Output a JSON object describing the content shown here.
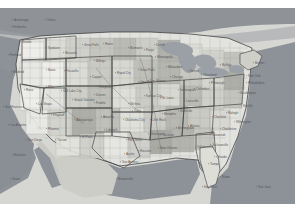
{
  "map": {
    "title": "United States reference map",
    "projection_note": "continental US with Alaska, Hawaii, Guam and Puerto Rico labels",
    "colors": {
      "background": "#ffffff",
      "land_base": "#e2e2de",
      "water_ocean": "#8d9298",
      "water_lake": "#9aa0a6",
      "border_state": "#3a3a3a",
      "border_county": "#9c9c98",
      "label_text": "#4a4a4a",
      "fill_light": "#efefec",
      "fill_mid": "#cfcfc9",
      "fill_dark": "#a9a9a3",
      "fill_darker": "#8f8f89"
    },
    "water_bodies": [
      {
        "name": "Pacific Ocean"
      },
      {
        "name": "Atlantic Ocean"
      },
      {
        "name": "Gulf of Mexico"
      },
      {
        "name": "Great Lakes"
      },
      {
        "name": "Gulf of California"
      }
    ],
    "cities": [
      {
        "name": "Anchorage",
        "x": 14,
        "y": 13,
        "size": "sm"
      },
      {
        "name": "Fairbanks",
        "x": 13,
        "y": 20,
        "size": "sm"
      },
      {
        "name": "Yukon",
        "x": 47,
        "y": 13,
        "size": "sm"
      },
      {
        "name": "Seattle",
        "x": 22,
        "y": 35,
        "size": "sm"
      },
      {
        "name": "Portland",
        "x": 10,
        "y": 48,
        "size": "sm"
      },
      {
        "name": "Spokane",
        "x": 48,
        "y": 41,
        "size": "sm"
      },
      {
        "name": "Missoula",
        "x": 65,
        "y": 46,
        "size": "sm"
      },
      {
        "name": "Havre",
        "x": 105,
        "y": 37,
        "size": "sm"
      },
      {
        "name": "Great Falls",
        "x": 84,
        "y": 38,
        "size": "sm"
      },
      {
        "name": "Billings",
        "x": 96,
        "y": 54,
        "size": "sm"
      },
      {
        "name": "Bismarck",
        "x": 130,
        "y": 41,
        "size": "sm"
      },
      {
        "name": "Fargo",
        "x": 146,
        "y": 43,
        "size": "sm"
      },
      {
        "name": "Medford",
        "x": 13,
        "y": 65,
        "size": "sm"
      },
      {
        "name": "Boise",
        "x": 48,
        "y": 63,
        "size": "sm"
      },
      {
        "name": "Pocatello",
        "x": 66,
        "y": 64,
        "size": "sm"
      },
      {
        "name": "Casper",
        "x": 92,
        "y": 70,
        "size": "sm"
      },
      {
        "name": "Rapid City",
        "x": 117,
        "y": 66,
        "size": "sm"
      },
      {
        "name": "Sioux Falls",
        "x": 140,
        "y": 63,
        "size": "sm"
      },
      {
        "name": "Minneapolis",
        "x": 157,
        "y": 50,
        "size": "sm"
      },
      {
        "name": "Duluth",
        "x": 156,
        "y": 38,
        "size": "sm"
      },
      {
        "name": "Reno",
        "x": 26,
        "y": 83,
        "size": "sm"
      },
      {
        "name": "Elko",
        "x": 48,
        "y": 80,
        "size": "sm"
      },
      {
        "name": "Salt Lake City",
        "x": 63,
        "y": 84,
        "size": "sm"
      },
      {
        "name": "Cheyenne",
        "x": 99,
        "y": 80,
        "size": "sm"
      },
      {
        "name": "Denver",
        "x": 96,
        "y": 88,
        "size": "sm"
      },
      {
        "name": "Omaha",
        "x": 140,
        "y": 75,
        "size": "sm"
      },
      {
        "name": "Des Moines",
        "x": 150,
        "y": 74,
        "size": "sm"
      },
      {
        "name": "Chicago",
        "x": 172,
        "y": 70,
        "size": "sm"
      },
      {
        "name": "Milwaukee",
        "x": 168,
        "y": 60,
        "size": "sm"
      },
      {
        "name": "Detroit",
        "x": 190,
        "y": 64,
        "size": "sm"
      },
      {
        "name": "Cleveland",
        "x": 203,
        "y": 68,
        "size": "sm"
      },
      {
        "name": "Buffalo",
        "x": 222,
        "y": 58,
        "size": "sm"
      },
      {
        "name": "Boston",
        "x": 255,
        "y": 56,
        "size": "sm"
      },
      {
        "name": "New York",
        "x": 248,
        "y": 69,
        "size": "sm"
      },
      {
        "name": "Philadelphia",
        "x": 248,
        "y": 76,
        "size": "sm"
      },
      {
        "name": "Pittsburgh",
        "x": 211,
        "y": 76,
        "size": "sm"
      },
      {
        "name": "San Francisco",
        "x": 5,
        "y": 100,
        "size": "sm"
      },
      {
        "name": "Las Vegas",
        "x": 38,
        "y": 97,
        "size": "sm"
      },
      {
        "name": "Grand Junction",
        "x": 74,
        "y": 93,
        "size": "sm"
      },
      {
        "name": "Pueblo",
        "x": 96,
        "y": 96,
        "size": "sm"
      },
      {
        "name": "Wichita",
        "x": 130,
        "y": 97,
        "size": "sm"
      },
      {
        "name": "Kansas City",
        "x": 146,
        "y": 89,
        "size": "sm"
      },
      {
        "name": "St. Louis",
        "x": 162,
        "y": 91,
        "size": "sm"
      },
      {
        "name": "Indianapolis",
        "x": 180,
        "y": 83,
        "size": "sm"
      },
      {
        "name": "Columbus",
        "x": 196,
        "y": 82,
        "size": "sm"
      },
      {
        "name": "Washington",
        "x": 240,
        "y": 86,
        "size": "sm"
      },
      {
        "name": "Los Angeles",
        "x": 10,
        "y": 118,
        "size": "sm"
      },
      {
        "name": "San Diego",
        "x": 28,
        "y": 133,
        "size": "sm"
      },
      {
        "name": "Phoenix",
        "x": 48,
        "y": 122,
        "size": "sm"
      },
      {
        "name": "Flagstaff",
        "x": 53,
        "y": 108,
        "size": "sm"
      },
      {
        "name": "Albuquerque",
        "x": 76,
        "y": 113,
        "size": "sm"
      },
      {
        "name": "Amarillo",
        "x": 103,
        "y": 110,
        "size": "sm"
      },
      {
        "name": "Oklahoma City",
        "x": 125,
        "y": 113,
        "size": "sm"
      },
      {
        "name": "Tulsa",
        "x": 134,
        "y": 104,
        "size": "sm"
      },
      {
        "name": "Little Rock",
        "x": 152,
        "y": 113,
        "size": "sm"
      },
      {
        "name": "Memphis",
        "x": 164,
        "y": 107,
        "size": "sm"
      },
      {
        "name": "Nashville",
        "x": 180,
        "y": 104,
        "size": "sm"
      },
      {
        "name": "Louisville",
        "x": 186,
        "y": 94,
        "size": "sm"
      },
      {
        "name": "Charlotte",
        "x": 214,
        "y": 110,
        "size": "sm"
      },
      {
        "name": "Raleigh",
        "x": 228,
        "y": 106,
        "size": "sm"
      },
      {
        "name": "Norfolk",
        "x": 243,
        "y": 99,
        "size": "sm"
      },
      {
        "name": "Tucson",
        "x": 57,
        "y": 133,
        "size": "sm"
      },
      {
        "name": "El Paso",
        "x": 82,
        "y": 130,
        "size": "sm"
      },
      {
        "name": "Lubbock",
        "x": 106,
        "y": 123,
        "size": "sm"
      },
      {
        "name": "Fort Worth",
        "x": 128,
        "y": 133,
        "size": "sm"
      },
      {
        "name": "Shreveport",
        "x": 150,
        "y": 127,
        "size": "sm"
      },
      {
        "name": "Jackson",
        "x": 163,
        "y": 128,
        "size": "sm"
      },
      {
        "name": "Birmingham",
        "x": 178,
        "y": 121,
        "size": "sm"
      },
      {
        "name": "Atlanta",
        "x": 190,
        "y": 119,
        "size": "sm"
      },
      {
        "name": "Savannah",
        "x": 212,
        "y": 128,
        "size": "sm"
      },
      {
        "name": "Charleston",
        "x": 222,
        "y": 122,
        "size": "sm"
      },
      {
        "name": "Wilmington",
        "x": 236,
        "y": 115,
        "size": "sm"
      },
      {
        "name": "Austin",
        "x": 126,
        "y": 147,
        "size": "sm"
      },
      {
        "name": "Houston",
        "x": 140,
        "y": 144,
        "size": "sm"
      },
      {
        "name": "New Orleans",
        "x": 160,
        "y": 141,
        "size": "sm"
      },
      {
        "name": "Tallahassee",
        "x": 197,
        "y": 140,
        "size": "sm"
      },
      {
        "name": "Jacksonville",
        "x": 212,
        "y": 138,
        "size": "sm"
      },
      {
        "name": "San Antonio",
        "x": 122,
        "y": 155,
        "size": "sm"
      },
      {
        "name": "Orlando",
        "x": 216,
        "y": 150,
        "size": "sm"
      },
      {
        "name": "Tampa",
        "x": 210,
        "y": 157,
        "size": "sm"
      },
      {
        "name": "Brownsville",
        "x": 118,
        "y": 172,
        "size": "sm"
      },
      {
        "name": "Miami",
        "x": 222,
        "y": 170,
        "size": "sm"
      },
      {
        "name": "Key West",
        "x": 204,
        "y": 180,
        "size": "sm"
      },
      {
        "name": "Honolulu",
        "x": 14,
        "y": 148,
        "size": "sm"
      },
      {
        "name": "Guam",
        "x": 12,
        "y": 172,
        "size": "sm"
      },
      {
        "name": "San Juan",
        "x": 258,
        "y": 180,
        "size": "sm"
      }
    ]
  }
}
